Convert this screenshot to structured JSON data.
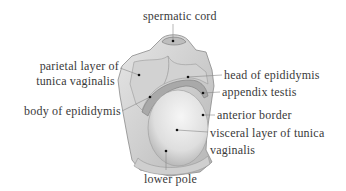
{
  "figure": {
    "type": "anatomical-illustration",
    "colors": {
      "background": "#ffffff",
      "text": "#3a3a3a",
      "leader": "#777777",
      "tissue_light": "#eeeeee",
      "tissue_mid": "#c9c9c9",
      "tissue_dark": "#8a8a8a",
      "dot": "#111111"
    }
  },
  "labels": {
    "spermatic_cord": "spermatic cord",
    "parietal_layer_line1": "parietal layer of",
    "parietal_layer_line2": "tunica vaginalis",
    "head_of_epididymis": "head of epididymis",
    "appendix_testis": "appendix testis",
    "body_of_epididymis": "body of epididymis",
    "anterior_border": "anterior border",
    "visceral_layer_line1": "visceral layer of tunica",
    "visceral_layer_line2": "vaginalis",
    "lower_pole": "lower pole"
  }
}
